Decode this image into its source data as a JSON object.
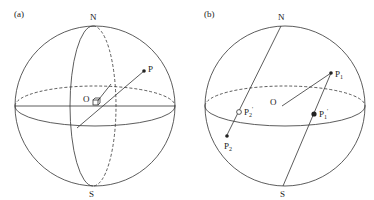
{
  "figure": {
    "panel_a": {
      "tag": "(a)",
      "north_label": "N",
      "south_label": "S",
      "origin_label": "O",
      "point_label": "P"
    },
    "panel_b": {
      "tag": "(b)",
      "north_label": "N",
      "south_label": "S",
      "origin_label": "O",
      "p1_label": "P",
      "p1_sub": "1",
      "p1_proj_label": "P",
      "p1_proj_sub": "1",
      "p1_proj_prime": "'",
      "p2_label": "P",
      "p2_sub": "2",
      "p2_proj_label": "P",
      "p2_proj_sub": "2",
      "p2_proj_prime": "'"
    },
    "colors": {
      "stroke": "#333333",
      "background": "#ffffff"
    }
  }
}
